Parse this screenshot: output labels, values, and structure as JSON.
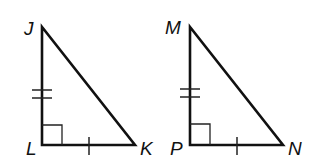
{
  "diagram": {
    "type": "geometry-congruent-right-triangles",
    "triangles": [
      {
        "name": "triangle-JLK",
        "vertices": {
          "top": "J",
          "right_angle": "L",
          "right": "K"
        },
        "marks": {
          "vertical_leg": "double-tick",
          "horizontal_leg": "single-tick",
          "right_angle_at": "L"
        }
      },
      {
        "name": "triangle-MPN",
        "vertices": {
          "top": "M",
          "right_angle": "P",
          "right": "N"
        },
        "marks": {
          "vertical_leg": "double-tick",
          "horizontal_leg": "single-tick",
          "right_angle_at": "P"
        }
      }
    ],
    "colors": {
      "stroke": "#111111",
      "background": "#ffffff"
    }
  },
  "labels": {
    "J": "J",
    "L": "L",
    "K": "K",
    "M": "M",
    "P": "P",
    "N": "N"
  }
}
